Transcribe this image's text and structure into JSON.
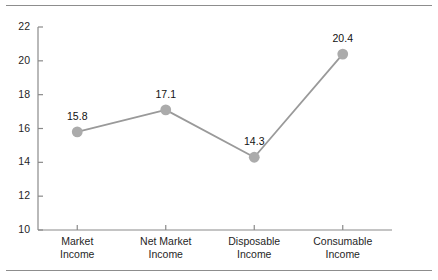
{
  "figure": {
    "background_color": "#ffffff",
    "rule_color": "#8d8d8d",
    "axis_color": "#8a8a8a",
    "text_color": "#1f1f1f"
  },
  "chart_data": {
    "type": "line",
    "title": "",
    "subtitle": "",
    "xlabel": "",
    "ylabel": "",
    "categories": [
      "Market Income",
      "Net Market Income",
      "Disposable Income",
      "Consumable Income"
    ],
    "category_lines": [
      {
        "line1": "Market",
        "line2": "Income"
      },
      {
        "line1": "Net Market",
        "line2": "Income"
      },
      {
        "line1": "Disposable",
        "line2": "Income"
      },
      {
        "line1": "Consumable",
        "line2": "Income"
      }
    ],
    "values": [
      15.8,
      17.1,
      14.3,
      20.4
    ],
    "point_labels": [
      "15.8",
      "17.1",
      "14.3",
      "20.4"
    ],
    "ylim": [
      10,
      22
    ],
    "yticks": [
      22,
      20,
      18,
      16,
      14,
      12,
      10
    ],
    "ytick_labels": [
      "22",
      "20",
      "18",
      "16",
      "14",
      "12",
      "10"
    ],
    "grid": false,
    "legend": null,
    "legend_position": "none",
    "series": [
      {
        "name": "Gini coefficient",
        "values": [
          15.8,
          17.1,
          14.3,
          20.4
        ],
        "line_color": "#9a9a9a",
        "marker_color": "#ababab",
        "marker_shape": "circle"
      }
    ]
  }
}
